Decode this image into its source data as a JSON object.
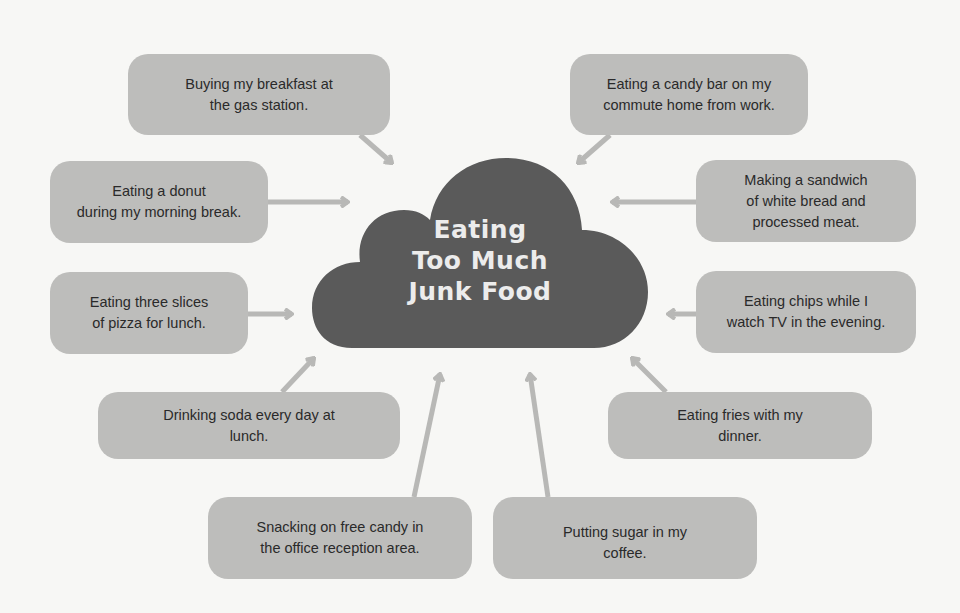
{
  "diagram": {
    "type": "cause-map",
    "center": {
      "label": "Eating\nToo Much\nJunk Food",
      "shape": "cloud",
      "color": "#5a5a5a"
    },
    "colors": {
      "background": "#f7f7f5",
      "box_fill": "#bdbdbb",
      "arrow": "#b8b8b6",
      "text": "#2a2a2a",
      "center_text": "#ececec"
    },
    "causes": [
      {
        "id": "breakfast-gas-station",
        "label": "Buying my breakfast at\nthe gas station."
      },
      {
        "id": "candy-bar-commute",
        "label": "Eating a candy bar on my\ncommute home from work."
      },
      {
        "id": "donut-morning-break",
        "label": "Eating a donut\nduring my morning break."
      },
      {
        "id": "sandwich-white-bread",
        "label": "Making a sandwich\nof white bread and\nprocessed meat."
      },
      {
        "id": "pizza-lunch",
        "label": "Eating three slices\nof pizza for lunch."
      },
      {
        "id": "chips-tv",
        "label": "Eating chips while I\nwatch TV in the evening."
      },
      {
        "id": "soda-lunch",
        "label": "Drinking soda every day at\nlunch."
      },
      {
        "id": "fries-dinner",
        "label": "Eating fries with my\ndinner."
      },
      {
        "id": "free-candy-office",
        "label": "Snacking on free candy in\nthe office reception area."
      },
      {
        "id": "sugar-coffee",
        "label": "Putting sugar in my\ncoffee."
      }
    ]
  }
}
